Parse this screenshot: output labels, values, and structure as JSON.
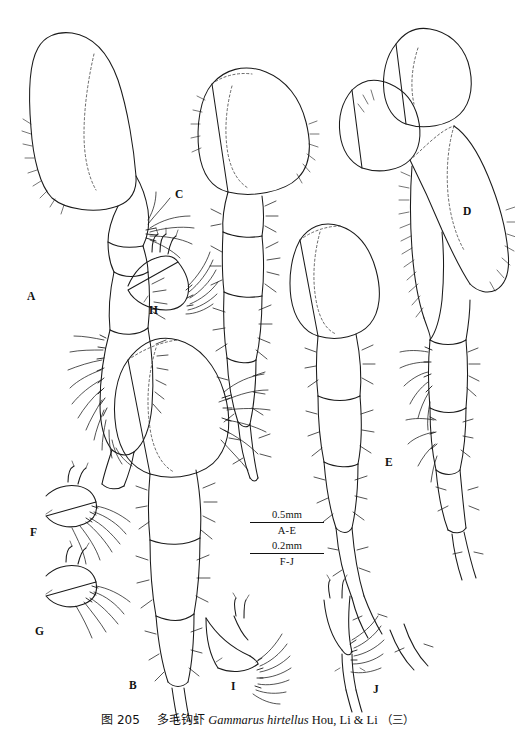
{
  "figure": {
    "number": "图 205",
    "chinese_name": "多毛钩虾",
    "scientific_name": "Gammarus hirtellus",
    "authority": "Hou, Li & Li",
    "part": "（三）",
    "caption_full": "图 205　多毛钩虾 Gammarus hirtellus Hou, Li & Li（三）"
  },
  "panels": [
    {
      "id": "A",
      "label": "A",
      "x": 27,
      "y": 291
    },
    {
      "id": "B",
      "label": "B",
      "x": 129,
      "y": 680
    },
    {
      "id": "C",
      "label": "C",
      "x": 175,
      "y": 189
    },
    {
      "id": "D",
      "label": "D",
      "x": 463,
      "y": 206
    },
    {
      "id": "E",
      "label": "E",
      "x": 385,
      "y": 457
    },
    {
      "id": "F",
      "label": "F",
      "x": 30,
      "y": 527
    },
    {
      "id": "G",
      "label": "G",
      "x": 35,
      "y": 626
    },
    {
      "id": "H",
      "label": "H",
      "x": 149,
      "y": 305
    },
    {
      "id": "I",
      "label": "I",
      "x": 231,
      "y": 681
    },
    {
      "id": "J",
      "label": "J",
      "x": 373,
      "y": 684
    }
  ],
  "scale_bars": [
    {
      "value": "0.5mm",
      "range": "A-E"
    },
    {
      "value": "0.2mm",
      "range": "F-J"
    }
  ],
  "colors": {
    "background": "#ffffff",
    "ink": "#1a1a1a",
    "text": "#111111"
  }
}
